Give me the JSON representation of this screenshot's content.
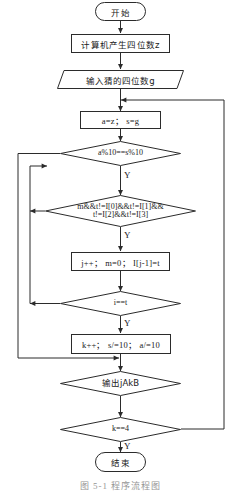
{
  "figure": {
    "caption": "图 5-1  程序流程图",
    "kind": "flowchart",
    "language": "zh-CN",
    "yes_label": "Y"
  },
  "nodes": [
    {
      "id": "start",
      "shape": "terminal",
      "text": "开始"
    },
    {
      "id": "gen",
      "shape": "process",
      "text": "计算机产生四位数z"
    },
    {
      "id": "input",
      "shape": "parallelogram",
      "text": "输入猜的四位数g"
    },
    {
      "id": "assign",
      "shape": "process",
      "text": "a=z； s=g"
    },
    {
      "id": "cond1",
      "shape": "decision",
      "text": "a%10==s%10"
    },
    {
      "id": "cond2",
      "shape": "decision",
      "text_line1": "m&&t!=I[0]&&t!=I[1]&&",
      "text_line2": "t!=I[2]&&t!=I[3]"
    },
    {
      "id": "update",
      "shape": "process",
      "text": "j++； m=0； I[j-1]=t"
    },
    {
      "id": "cond3",
      "shape": "decision",
      "text": "i==t"
    },
    {
      "id": "step",
      "shape": "process",
      "text": "k++； s/=10； a/=10"
    },
    {
      "id": "output",
      "shape": "decision",
      "text": "输出jAkB"
    },
    {
      "id": "cond4",
      "shape": "decision",
      "text": "k==4"
    },
    {
      "id": "end",
      "shape": "terminal",
      "text": "结束"
    }
  ],
  "branch_labels": {
    "cond1_yes": "Y",
    "cond2_yes": "Y",
    "cond3_yes": "Y",
    "cond4_yes": "Y"
  },
  "colors": {
    "stroke": "#2b2b2b",
    "fill": "#ffffff",
    "text": "#1a1a1a"
  }
}
